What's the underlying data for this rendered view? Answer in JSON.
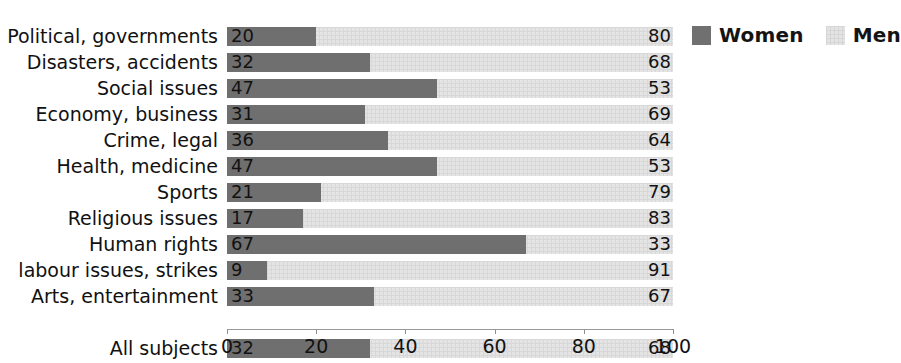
{
  "chart_data": {
    "type": "bar",
    "orientation": "horizontal",
    "stacked": true,
    "stacked_normalized": true,
    "title": "",
    "subtitle": "",
    "xlabel": "",
    "ylabel": "",
    "xlim": [
      0,
      100
    ],
    "xticks": [
      0,
      20,
      40,
      60,
      80,
      100
    ],
    "xtick_labels": [
      "0",
      "20",
      "40",
      "60",
      "80",
      "100"
    ],
    "grid": false,
    "legend_position": "top-right",
    "categories": [
      "Political, governments",
      "Disasters, accidents",
      "Social issues",
      "Economy, business",
      "Crime, legal",
      "Health, medicine",
      "Sports",
      "Religious issues",
      "Human rights",
      "labour issues, strikes",
      "Arts, entertainment",
      "All subjects"
    ],
    "series": [
      {
        "name": "Women",
        "color": "#6f6f6f",
        "values": [
          20,
          32,
          47,
          31,
          36,
          47,
          21,
          17,
          67,
          9,
          33,
          32
        ]
      },
      {
        "name": "Men",
        "color": "#e4e4e4",
        "values": [
          80,
          68,
          53,
          69,
          64,
          53,
          79,
          83,
          33,
          91,
          67,
          68
        ]
      }
    ],
    "summary_row_index": 11,
    "annotations": []
  },
  "legend": {
    "entries": [
      {
        "label": "Women",
        "swatch": "women"
      },
      {
        "label": "Men",
        "swatch": "men"
      }
    ]
  }
}
